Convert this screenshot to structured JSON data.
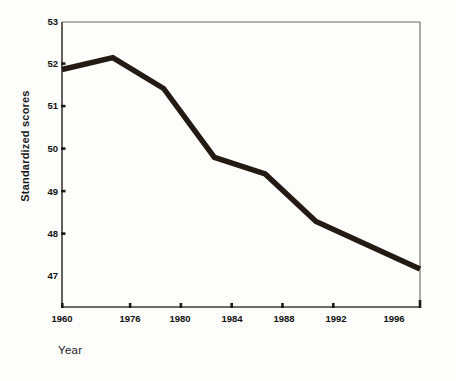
{
  "chart_data": {
    "type": "line",
    "title": "",
    "xlabel": "Year",
    "ylabel": "Standardized scores",
    "x": [
      1960,
      1976,
      1980,
      1984,
      1988,
      1992,
      1996
    ],
    "xtick_labels": [
      "1960",
      "1976",
      "1980",
      "1984",
      "1988",
      "1992",
      "1996"
    ],
    "ytick_labels": [
      "47",
      "48",
      "49",
      "50",
      "51",
      "52",
      "53"
    ],
    "ytick_values": [
      47,
      48,
      49,
      50,
      51,
      52,
      53
    ],
    "values": [
      52.0,
      52.25,
      51.6,
      50.15,
      49.8,
      48.8,
      47.8
    ],
    "series": [
      {
        "name": "Standardized scores",
        "values": [
          52.0,
          52.25,
          51.6,
          50.15,
          49.8,
          48.8,
          47.8
        ]
      }
    ],
    "xlim": [
      1960,
      1996
    ],
    "ylim": [
      47,
      53
    ],
    "grid": false,
    "legend": false,
    "line_color": "#231a14",
    "axis_color": "#3d3a36"
  }
}
